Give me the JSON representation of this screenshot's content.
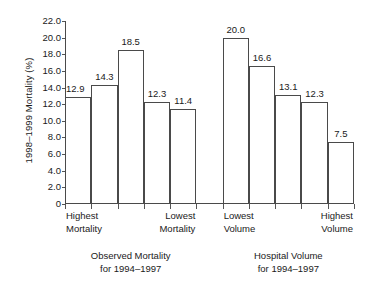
{
  "chart_data": {
    "type": "bar",
    "title": "",
    "subtitle": "",
    "xlabel": "",
    "ylabel": "1998–1999 Mortality (%)",
    "ylim": [
      0,
      22
    ],
    "ytick_labels": [
      "22.0",
      "20.0",
      "18.0",
      "16.0",
      "14.0",
      "12.0",
      "10.0",
      "8.0",
      "6.0",
      "4.0",
      "2.0",
      "0"
    ],
    "ytick_values": [
      22.0,
      20.0,
      18.0,
      16.0,
      14.0,
      12.0,
      10.0,
      8.0,
      6.0,
      4.0,
      2.0,
      0
    ],
    "grid": false,
    "legend": "none",
    "bar_outline_color": "#4a4a4a",
    "bar_fill_color": "#ffffff",
    "axis_color": "#4a4a4a",
    "slots": 11,
    "groups": [
      {
        "caption_line1": "Observed Mortality",
        "caption_line2": "for 1994–1997",
        "slot_start": 1,
        "left_category": "Highest Mortality",
        "left_category_line1": "Highest",
        "left_category_line2": "Mortality",
        "right_category": "Lowest Mortality",
        "right_category_line1": "Lowest",
        "right_category_line2": "Mortality",
        "values": [
          12.9,
          14.3,
          18.5,
          12.3,
          11.4
        ],
        "value_labels": [
          "12.9",
          "14.3",
          "18.5",
          "12.3",
          "11.4"
        ]
      },
      {
        "caption_line1": "Hospital Volume",
        "caption_line2": "for 1994–1997",
        "slot_start": 7,
        "left_category": "Lowest Volume",
        "left_category_line1": "Lowest",
        "left_category_line2": "Volume",
        "right_category": "Highest Volume",
        "right_category_line1": "Highest",
        "right_category_line2": "Volume",
        "values": [
          20.0,
          16.6,
          13.1,
          12.3,
          7.5
        ],
        "value_labels": [
          "20.0",
          "16.6",
          "13.1",
          "12.3",
          "7.5"
        ]
      }
    ],
    "categories": [
      "Highest Mortality",
      "",
      "",
      "",
      "Lowest Mortality",
      "",
      "Lowest Volume",
      "",
      "",
      "",
      "Highest Volume"
    ],
    "values": [
      12.9,
      14.3,
      18.5,
      12.3,
      11.4,
      null,
      20.0,
      16.6,
      13.1,
      12.3,
      7.5
    ]
  }
}
